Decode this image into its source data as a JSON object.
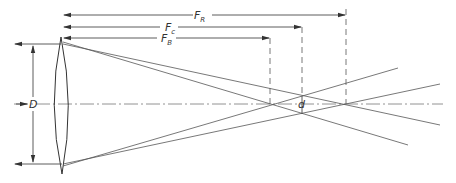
{
  "diagram": {
    "labels": {
      "diameter": "D",
      "focus_red": {
        "main": "F",
        "sub": "R"
      },
      "focus_c": {
        "main": "F",
        "sub": "c"
      },
      "focus_blue": {
        "main": "F",
        "sub": "B"
      },
      "blur_diameter": "d"
    },
    "colors": {
      "ink": "#4a4a4a",
      "background": "#ffffff"
    }
  }
}
